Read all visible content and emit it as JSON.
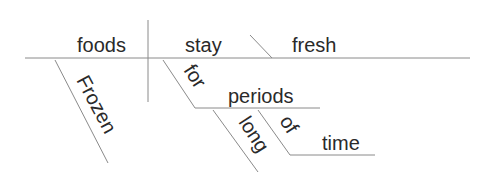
{
  "diagram": {
    "type": "sentence-diagram",
    "sentence": "Frozen foods stay fresh for long periods of time",
    "words": {
      "subject": "foods",
      "verb": "stay",
      "complement": "fresh",
      "subject_modifier": "Frozen",
      "preposition": "for",
      "prep_object": "periods",
      "object_modifier": "long",
      "preposition2": "of",
      "prep_object2": "time"
    }
  }
}
